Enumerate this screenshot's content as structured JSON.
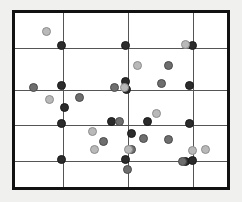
{
  "figure": {
    "title": "",
    "background_color": "#f0f0ee",
    "plot_background_color": "#ffffff",
    "border_color": "#111111",
    "gridline_color": "#555555"
  },
  "legend": {
    "series_colors": {
      "dark": "#2b2b2b",
      "mid": "#6e6e6e",
      "light": "#b9b9b9"
    }
  },
  "chart_data": {
    "type": "scatter",
    "title": "",
    "xlabel": "",
    "ylabel": "",
    "xlim": [
      0,
      218
    ],
    "ylim": [
      0,
      180
    ],
    "grid": true,
    "grid_x": [
      48,
      113,
      178
    ],
    "grid_y": [
      35,
      77,
      112,
      148
    ],
    "legend_position": "none",
    "series": [
      {
        "name": "dark",
        "color": "#2b2b2b",
        "marker_size": 9,
        "points": [
          {
            "x": 46,
            "y": 32
          },
          {
            "x": 110,
            "y": 32
          },
          {
            "x": 177,
            "y": 32
          },
          {
            "x": 46,
            "y": 72
          },
          {
            "x": 110,
            "y": 68
          },
          {
            "x": 111,
            "y": 76
          },
          {
            "x": 174,
            "y": 72
          },
          {
            "x": 49,
            "y": 94
          },
          {
            "x": 96,
            "y": 108
          },
          {
            "x": 132,
            "y": 108
          },
          {
            "x": 46,
            "y": 110
          },
          {
            "x": 174,
            "y": 110
          },
          {
            "x": 116,
            "y": 120
          },
          {
            "x": 46,
            "y": 146
          },
          {
            "x": 110,
            "y": 146
          },
          {
            "x": 170,
            "y": 148
          },
          {
            "x": 177,
            "y": 147
          }
        ]
      },
      {
        "name": "mid",
        "color": "#6e6e6e",
        "marker_size": 9,
        "points": [
          {
            "x": 153,
            "y": 52
          },
          {
            "x": 18,
            "y": 74
          },
          {
            "x": 146,
            "y": 70
          },
          {
            "x": 99,
            "y": 74
          },
          {
            "x": 64,
            "y": 84
          },
          {
            "x": 104,
            "y": 108
          },
          {
            "x": 128,
            "y": 125
          },
          {
            "x": 116,
            "y": 136
          },
          {
            "x": 153,
            "y": 126
          },
          {
            "x": 88,
            "y": 128
          },
          {
            "x": 112,
            "y": 156
          },
          {
            "x": 167,
            "y": 148
          }
        ]
      },
      {
        "name": "light",
        "color": "#b9b9b9",
        "marker_size": 9,
        "points": [
          {
            "x": 31,
            "y": 18
          },
          {
            "x": 170,
            "y": 31
          },
          {
            "x": 122,
            "y": 52
          },
          {
            "x": 109,
            "y": 74
          },
          {
            "x": 34,
            "y": 86
          },
          {
            "x": 141,
            "y": 100
          },
          {
            "x": 77,
            "y": 118
          },
          {
            "x": 79,
            "y": 136
          },
          {
            "x": 113,
            "y": 136
          },
          {
            "x": 190,
            "y": 136
          },
          {
            "x": 177,
            "y": 137
          }
        ]
      }
    ]
  }
}
